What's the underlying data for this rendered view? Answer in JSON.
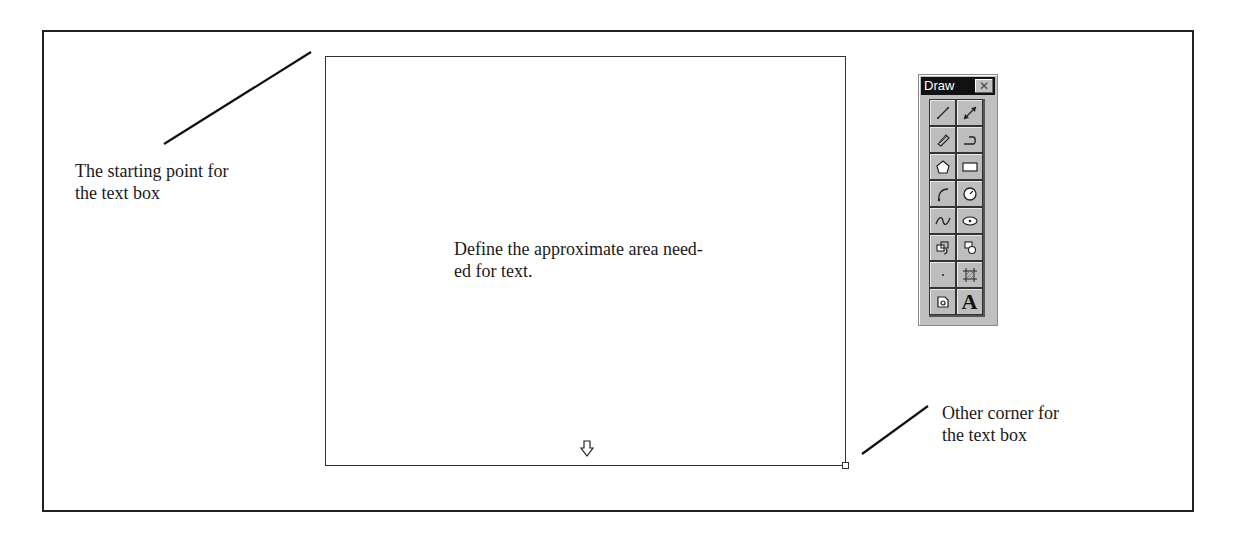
{
  "annotations": {
    "start_label_line1": "The starting point for",
    "start_label_line2": "the text box",
    "end_label_line1": "Other corner for",
    "end_label_line2": "the text box"
  },
  "text_box": {
    "content_line1": "Define the approximate area need-",
    "content_line2": "ed for text."
  },
  "draw_toolbar": {
    "title": "Draw",
    "close_glyph": "✕",
    "tools": [
      {
        "name": "line",
        "icon": "line-icon"
      },
      {
        "name": "arrow-line",
        "icon": "double-arrow-line-icon"
      },
      {
        "name": "freehand",
        "icon": "pencil-icon"
      },
      {
        "name": "polyline",
        "icon": "polyline-icon"
      },
      {
        "name": "polygon",
        "icon": "pentagon-icon"
      },
      {
        "name": "rectangle",
        "icon": "rectangle-icon"
      },
      {
        "name": "arc",
        "icon": "arc-icon"
      },
      {
        "name": "circle",
        "icon": "circle-icon"
      },
      {
        "name": "spline",
        "icon": "curve-icon"
      },
      {
        "name": "ellipse",
        "icon": "ellipse-icon"
      },
      {
        "name": "copy-object",
        "icon": "copy-object-icon"
      },
      {
        "name": "move-object",
        "icon": "move-object-icon"
      },
      {
        "name": "point",
        "icon": "point-icon"
      },
      {
        "name": "fill-area",
        "icon": "hatch-icon"
      },
      {
        "name": "image",
        "icon": "image-icon"
      },
      {
        "name": "text",
        "icon": "text-icon",
        "glyph": "A"
      }
    ]
  }
}
